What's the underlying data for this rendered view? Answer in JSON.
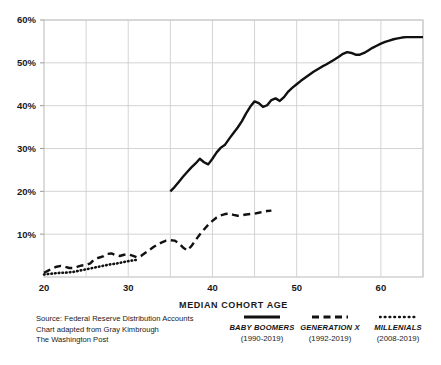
{
  "chart_data": {
    "type": "line",
    "title": "",
    "xlabel": "MEDIAN COHORT AGE",
    "ylabel": "",
    "xlim": [
      20,
      65
    ],
    "ylim": [
      0,
      60
    ],
    "grid": true,
    "x_ticks": [
      20,
      30,
      40,
      50,
      60
    ],
    "x_tick_labels": [
      "20",
      "30",
      "40",
      "50",
      "60"
    ],
    "x_minor_ticks": [
      25,
      35,
      45,
      55,
      65
    ],
    "y_ticks": [
      10,
      20,
      30,
      40,
      50,
      60
    ],
    "y_tick_labels": [
      "10%",
      "20%",
      "30%",
      "40%",
      "50%",
      "60%"
    ],
    "legend_position": "bottom",
    "series": [
      {
        "name": "BABY BOOMERS",
        "years": "(1990-2019)",
        "style": "solid",
        "color": "#111111",
        "x": [
          35,
          35.5,
          36,
          36.5,
          37,
          37.5,
          38,
          38.5,
          39,
          39.5,
          40,
          40.5,
          41,
          41.5,
          42,
          42.5,
          43,
          43.5,
          44,
          44.5,
          45,
          45.5,
          46,
          46.5,
          47,
          47.5,
          48,
          48.5,
          49,
          49.5,
          50,
          50.5,
          51,
          51.5,
          52,
          52.5,
          53,
          53.5,
          54,
          54.5,
          55,
          55.5,
          56,
          56.5,
          57,
          57.5,
          58,
          58.5,
          59,
          59.5,
          60,
          60.5,
          61,
          61.5,
          62,
          62.5,
          63,
          63.5,
          64,
          64.5,
          65
        ],
        "y": [
          20.0,
          21.0,
          22.2,
          23.4,
          24.5,
          25.6,
          26.5,
          27.6,
          26.8,
          26.3,
          27.6,
          29.1,
          30.2,
          30.9,
          32.3,
          33.6,
          34.9,
          36.4,
          38.2,
          39.8,
          41.0,
          40.6,
          39.7,
          40.1,
          41.3,
          41.7,
          41.1,
          42.0,
          43.3,
          44.2,
          45.0,
          45.8,
          46.5,
          47.2,
          47.9,
          48.5,
          49.1,
          49.6,
          50.2,
          50.8,
          51.4,
          52.1,
          52.5,
          52.3,
          51.9,
          51.9,
          52.3,
          52.9,
          53.5,
          54.0,
          54.5,
          54.9,
          55.2,
          55.5,
          55.7,
          55.9,
          56.0,
          56.0,
          56.0,
          56.0,
          56.0
        ]
      },
      {
        "name": "GENERATION X",
        "years": "(1992-2019)",
        "style": "dashed",
        "color": "#111111",
        "x": [
          20,
          20.5,
          21,
          21.5,
          22,
          22.5,
          23,
          23.5,
          24,
          24.5,
          25,
          25.5,
          26,
          26.5,
          27,
          27.5,
          28,
          28.5,
          29,
          29.5,
          30,
          30.5,
          31,
          31.5,
          32,
          32.5,
          33,
          33.5,
          34,
          34.5,
          35,
          35.5,
          36,
          36.5,
          37,
          37.5,
          38,
          38.5,
          39,
          39.5,
          40,
          40.5,
          41,
          41.5,
          42,
          42.5,
          43,
          43.5,
          44,
          44.5,
          45,
          45.5,
          46,
          46.5,
          47
        ],
        "y": [
          1.0,
          1.5,
          2.0,
          2.4,
          2.6,
          2.4,
          2.1,
          2.1,
          2.4,
          2.7,
          2.8,
          3.2,
          4.2,
          4.5,
          4.8,
          5.4,
          5.5,
          5.1,
          4.9,
          5.2,
          5.3,
          5.0,
          4.6,
          4.9,
          5.6,
          6.3,
          7.0,
          7.6,
          8.1,
          8.5,
          8.6,
          8.5,
          7.9,
          6.9,
          6.2,
          7.2,
          8.6,
          9.9,
          11.1,
          12.2,
          13.1,
          13.9,
          14.4,
          14.7,
          14.8,
          14.5,
          14.3,
          14.4,
          14.6,
          14.7,
          14.8,
          15.0,
          15.2,
          15.4,
          15.5
        ]
      },
      {
        "name": "MILLENIALS",
        "years": "(2008-2019)",
        "style": "dotted",
        "color": "#111111",
        "x": [
          20,
          20.5,
          21,
          21.5,
          22,
          22.5,
          23,
          23.5,
          24,
          24.5,
          25,
          25.5,
          26,
          26.5,
          27,
          27.5,
          28,
          28.5,
          29,
          29.5,
          30,
          30.5,
          31
        ],
        "y": [
          0.6,
          0.7,
          0.8,
          0.9,
          1.0,
          1.0,
          1.1,
          1.2,
          1.4,
          1.6,
          1.8,
          2.0,
          2.2,
          2.4,
          2.6,
          2.8,
          3.0,
          3.1,
          3.3,
          3.5,
          3.7,
          3.85,
          4.0
        ]
      }
    ]
  },
  "footer": {
    "source_lines": [
      "Source: Federal Reserve Distribution Accounts",
      "Chart adapted from Gray Kimbrough",
      "The Washington Post"
    ]
  }
}
